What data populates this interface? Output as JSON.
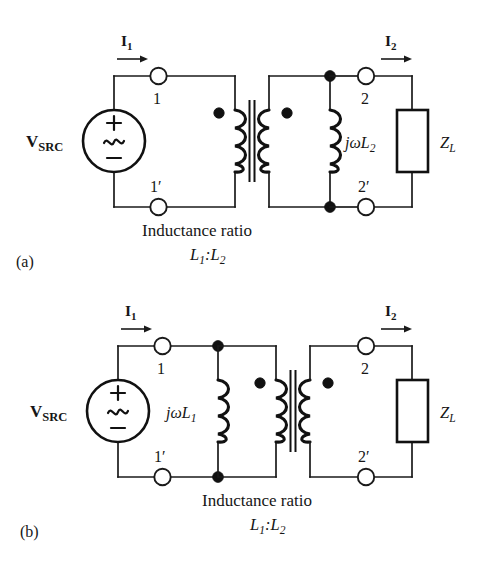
{
  "figure": {
    "kind": "circuit-schematic",
    "background": "#ffffff",
    "ink": "#111111"
  },
  "panels": [
    {
      "id": "a",
      "caption": "(a)",
      "source_label": "V",
      "source_sublabel": "SRC",
      "source_plus": "+",
      "source_wave": "~",
      "source_minus": "−",
      "current_left": "I",
      "current_left_sub": "1",
      "current_right": "I",
      "current_right_sub": "2",
      "terminal_top_left": "1",
      "terminal_bottom_left": "1′",
      "terminal_top_right": "2",
      "terminal_bottom_right": "2′",
      "shunt_inductor_label": "jωL",
      "shunt_inductor_sub": "2",
      "load_label": "Z",
      "load_sub": "L",
      "ratio_text": "Inductance ratio",
      "ratio_value_a": "L",
      "ratio_value_a_sub": "1",
      "ratio_value_sep": ":",
      "ratio_value_b": "L",
      "ratio_value_b_sub": "2"
    },
    {
      "id": "b",
      "caption": "(b)",
      "source_label": "V",
      "source_sublabel": "SRC",
      "source_plus": "+",
      "source_wave": "~",
      "source_minus": "−",
      "current_left": "I",
      "current_left_sub": "1",
      "current_right": "I",
      "current_right_sub": "2",
      "terminal_top_left": "1",
      "terminal_bottom_left": "1′",
      "terminal_top_right": "2",
      "terminal_bottom_right": "2′",
      "shunt_inductor_label": "jωL",
      "shunt_inductor_sub": "1",
      "load_label": "Z",
      "load_sub": "L",
      "ratio_text": "Inductance ratio",
      "ratio_value_a": "L",
      "ratio_value_a_sub": "1",
      "ratio_value_sep": ":",
      "ratio_value_b": "L",
      "ratio_value_b_sub": "2"
    }
  ]
}
